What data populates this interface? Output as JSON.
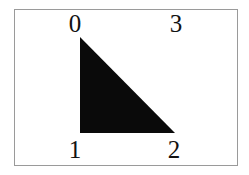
{
  "figure": {
    "kind": "geometry-diagram",
    "frame": {
      "border_color": "#9a9a9a",
      "background_color": "#ffffff",
      "border_width_px": 1
    },
    "shape": {
      "name": "right-triangle",
      "fill_color": "#0a0a0a",
      "points": "80,37 80,133 175,133",
      "vertices": [
        {
          "id": "top-left",
          "x": 80,
          "y": 37
        },
        {
          "id": "bottom-left",
          "x": 80,
          "y": 133
        },
        {
          "id": "bottom-right",
          "x": 175,
          "y": 133
        }
      ]
    },
    "labels": {
      "top_left": "0",
      "top_right": "3",
      "bottom_left": "1",
      "bottom_right": "2"
    }
  }
}
